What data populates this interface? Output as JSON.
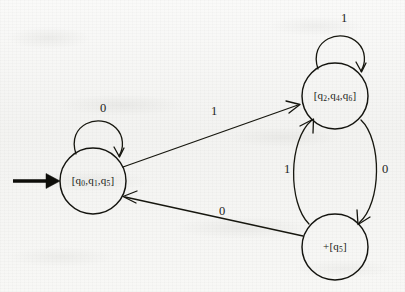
{
  "diagram": {
    "kind": "finite-automaton-state-diagram",
    "alphabet": [
      "0",
      "1"
    ],
    "colors": {
      "ink": "#15150e",
      "paper": "#f6f6f4",
      "start_arrow": "#0d0d09"
    },
    "states": [
      {
        "id": "s0",
        "label": "[q0,q1,q5]",
        "label_parts": [
          {
            "text": "[q"
          },
          {
            "text": "0",
            "sub": true
          },
          {
            "text": ",q"
          },
          {
            "text": "1",
            "sub": true
          },
          {
            "text": ",q"
          },
          {
            "text": "5",
            "sub": true
          },
          {
            "text": "]"
          }
        ],
        "cx": 93,
        "cy": 181,
        "r": 33,
        "is_start": true,
        "is_accepting": false
      },
      {
        "id": "s1",
        "label": "[q2,q4,q6]",
        "label_parts": [
          {
            "text": "[q"
          },
          {
            "text": "2",
            "sub": true
          },
          {
            "text": ",q"
          },
          {
            "text": "4",
            "sub": true
          },
          {
            "text": ",q"
          },
          {
            "text": "6",
            "sub": true
          },
          {
            "text": "]"
          }
        ],
        "cx": 335,
        "cy": 96,
        "r": 33,
        "is_start": false,
        "is_accepting": false
      },
      {
        "id": "s2",
        "label": "+[q5]",
        "label_parts": [
          {
            "text": "+[q"
          },
          {
            "text": "5",
            "sub": true
          },
          {
            "text": "]"
          }
        ],
        "cx": 335,
        "cy": 247,
        "r": 33,
        "is_start": false,
        "is_accepting": true
      }
    ],
    "transitions": [
      {
        "id": "t-s0-self",
        "from": "s0",
        "to": "s0",
        "symbol": "0",
        "kind": "self-loop",
        "label_x": 103,
        "label_y": 109
      },
      {
        "id": "t-s1-self",
        "from": "s1",
        "to": "s1",
        "symbol": "1",
        "kind": "self-loop",
        "label_x": 344,
        "label_y": 19
      },
      {
        "id": "t-s0-s1",
        "from": "s0",
        "to": "s1",
        "symbol": "1",
        "kind": "straight",
        "label_x": 214,
        "label_y": 112
      },
      {
        "id": "t-s2-s0",
        "from": "s2",
        "to": "s0",
        "symbol": "0",
        "kind": "straight",
        "label_x": 222,
        "label_y": 212
      },
      {
        "id": "t-s2-s1",
        "from": "s2",
        "to": "s1",
        "symbol": "1",
        "kind": "curve-up",
        "label_x": 287,
        "label_y": 170
      },
      {
        "id": "t-s1-s2",
        "from": "s1",
        "to": "s2",
        "symbol": "0",
        "kind": "curve-down",
        "label_x": 385,
        "label_y": 170
      }
    ],
    "start_arrow": {
      "name": "start-arrow",
      "x1": 13,
      "y1": 181,
      "x2": 58,
      "y2": 181
    }
  }
}
